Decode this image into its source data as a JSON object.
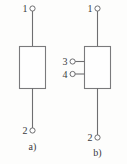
{
  "figure": {
    "background_color": "#fdfdfc",
    "line_color": "#6e6e70",
    "box_fill": "#fefefe",
    "text_color": "#3a3a3c"
  },
  "diagrams": [
    {
      "id": "a",
      "caption": "a)",
      "kind": "two-terminal-element",
      "terminals": [
        {
          "label": "1",
          "position": "top"
        },
        {
          "label": "2",
          "position": "bottom"
        }
      ]
    },
    {
      "id": "b",
      "caption": "b)",
      "kind": "four-terminal-element",
      "terminals": [
        {
          "label": "1",
          "position": "top"
        },
        {
          "label": "2",
          "position": "bottom"
        },
        {
          "label": "3",
          "position": "left-upper"
        },
        {
          "label": "4",
          "position": "left-lower"
        }
      ]
    }
  ]
}
